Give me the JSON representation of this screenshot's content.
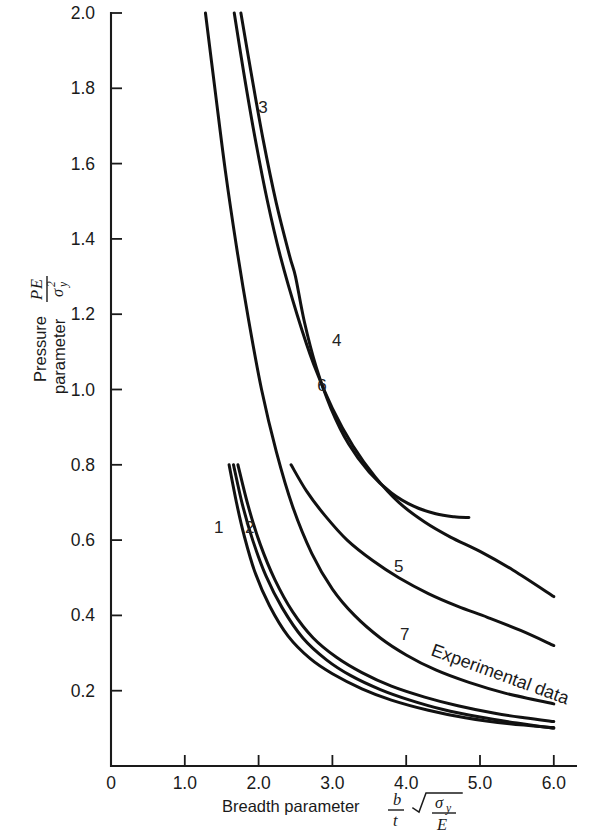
{
  "chart_data": {
    "type": "line",
    "title": "",
    "xlabel": "Breadth parameter (b/t)√(σy/E)",
    "ylabel": "Pressure parameter PE/σy²",
    "xlim": [
      0,
      6.3
    ],
    "ylim": [
      0,
      2.0
    ],
    "grid": false,
    "legend_position": "inline-curve-labels",
    "xticks": [
      "0",
      "1.0",
      "2.0",
      "3.0",
      "4.0",
      "5.0",
      "6.0"
    ],
    "xtick_values": [
      0,
      1.0,
      2.0,
      3.0,
      4.0,
      5.0,
      6.0
    ],
    "yticks": [
      "0.2",
      "0.4",
      "0.6",
      "0.8",
      "1.0",
      "1.2",
      "1.4",
      "1.6",
      "1.8",
      "2.0"
    ],
    "ytick_values": [
      0.2,
      0.4,
      0.6,
      0.8,
      1.0,
      1.2,
      1.4,
      1.6,
      1.8,
      2.0
    ],
    "annotations": [
      {
        "text": "Experimental data",
        "near_curve": "7"
      }
    ],
    "series": [
      {
        "name": "1",
        "label": "1",
        "label_x": 1.46,
        "label_y": 0.62,
        "points": [
          [
            1.6,
            0.8
          ],
          [
            1.7,
            0.7
          ],
          [
            1.8,
            0.615
          ],
          [
            1.95,
            0.515
          ],
          [
            2.15,
            0.425
          ],
          [
            2.4,
            0.345
          ],
          [
            2.7,
            0.285
          ],
          [
            3.0,
            0.245
          ],
          [
            3.4,
            0.205
          ],
          [
            3.8,
            0.175
          ],
          [
            4.3,
            0.148
          ],
          [
            4.8,
            0.128
          ],
          [
            5.4,
            0.112
          ],
          [
            6.0,
            0.102
          ]
        ]
      },
      {
        "name": "2",
        "label": "2",
        "label_x": 1.88,
        "label_y": 0.62,
        "points": [
          [
            1.66,
            0.8
          ],
          [
            1.78,
            0.695
          ],
          [
            1.92,
            0.6
          ],
          [
            2.1,
            0.505
          ],
          [
            2.32,
            0.42
          ],
          [
            2.6,
            0.34
          ],
          [
            2.92,
            0.282
          ],
          [
            3.25,
            0.24
          ],
          [
            3.65,
            0.203
          ],
          [
            4.05,
            0.175
          ],
          [
            4.5,
            0.15
          ],
          [
            5.0,
            0.13
          ],
          [
            5.5,
            0.114
          ],
          [
            6.0,
            0.1
          ]
        ]
      },
      {
        "name": "3",
        "label": "3",
        "label_x": 2.06,
        "label_y": 1.735,
        "points": [
          [
            1.28,
            2.0
          ],
          [
            1.42,
            1.78
          ],
          [
            1.55,
            1.58
          ],
          [
            1.7,
            1.38
          ],
          [
            1.86,
            1.19
          ],
          [
            2.04,
            1.0
          ],
          [
            2.24,
            0.835
          ],
          [
            2.46,
            0.69
          ],
          [
            2.72,
            0.565
          ],
          [
            3.0,
            0.47
          ],
          [
            3.3,
            0.4
          ],
          [
            3.65,
            0.34
          ],
          [
            4.0,
            0.295
          ],
          [
            4.4,
            0.255
          ],
          [
            4.85,
            0.222
          ],
          [
            5.35,
            0.193
          ],
          [
            6.0,
            0.165
          ]
        ]
      },
      {
        "name": "4",
        "label": "4",
        "label_x": 3.06,
        "label_y": 1.115,
        "points": [
          [
            1.67,
            2.0
          ],
          [
            1.8,
            1.84
          ],
          [
            1.95,
            1.67
          ],
          [
            2.12,
            1.5
          ],
          [
            2.3,
            1.35
          ],
          [
            2.52,
            1.2
          ],
          [
            2.75,
            1.065
          ],
          [
            3.0,
            0.95
          ],
          [
            3.28,
            0.85
          ],
          [
            3.58,
            0.768
          ],
          [
            3.9,
            0.7
          ],
          [
            4.25,
            0.648
          ],
          [
            4.6,
            0.608
          ],
          [
            5.0,
            0.57
          ],
          [
            5.45,
            0.52
          ],
          [
            6.0,
            0.45
          ]
        ]
      },
      {
        "name": "5",
        "label": "5",
        "label_x": 3.9,
        "label_y": 0.515,
        "points": [
          [
            2.44,
            0.8
          ],
          [
            2.65,
            0.73
          ],
          [
            2.9,
            0.665
          ],
          [
            3.2,
            0.6
          ],
          [
            3.55,
            0.545
          ],
          [
            3.9,
            0.5
          ],
          [
            4.3,
            0.458
          ],
          [
            4.7,
            0.424
          ],
          [
            5.1,
            0.395
          ],
          [
            5.55,
            0.36
          ],
          [
            6.0,
            0.32
          ]
        ]
      },
      {
        "name": "6",
        "label": "6",
        "label_x": 2.86,
        "label_y": 0.995,
        "points": [
          [
            1.76,
            2.0
          ],
          [
            1.9,
            1.84
          ],
          [
            2.06,
            1.665
          ],
          [
            2.24,
            1.495
          ],
          [
            2.42,
            1.355
          ],
          [
            2.5,
            1.3
          ],
          [
            2.62,
            1.18
          ],
          [
            2.78,
            1.06
          ],
          [
            2.98,
            0.95
          ],
          [
            3.22,
            0.855
          ],
          [
            3.5,
            0.78
          ],
          [
            3.8,
            0.725
          ],
          [
            4.1,
            0.69
          ],
          [
            4.4,
            0.67
          ],
          [
            4.65,
            0.662
          ],
          [
            4.85,
            0.66
          ]
        ]
      },
      {
        "name": "7",
        "label": "7",
        "label_x": 3.98,
        "label_y": 0.335,
        "points": [
          [
            1.72,
            0.8
          ],
          [
            1.86,
            0.69
          ],
          [
            2.02,
            0.59
          ],
          [
            2.22,
            0.495
          ],
          [
            2.46,
            0.41
          ],
          [
            2.74,
            0.34
          ],
          [
            3.06,
            0.288
          ],
          [
            3.4,
            0.248
          ],
          [
            3.8,
            0.212
          ],
          [
            4.25,
            0.183
          ],
          [
            4.7,
            0.16
          ],
          [
            5.2,
            0.14
          ],
          [
            5.6,
            0.128
          ],
          [
            6.0,
            0.118
          ]
        ]
      }
    ]
  },
  "axes": {
    "x_title_prefix": "Breadth parameter",
    "x_frac_num": "b",
    "x_frac_den": "t",
    "x_sqrt_num": "σ",
    "x_sqrt_num_sub": "y",
    "x_sqrt_den": "E",
    "y_title_line1": "Pressure",
    "y_title_line2": "parameter",
    "y_frac_num_p": "P",
    "y_frac_num_e": "E",
    "y_frac_den": "σ",
    "y_frac_den_sub": "y",
    "y_frac_den_sup": "2"
  },
  "colors": {
    "curve": "#111111",
    "axis": "#1a1a1a",
    "background": "#ffffff"
  }
}
